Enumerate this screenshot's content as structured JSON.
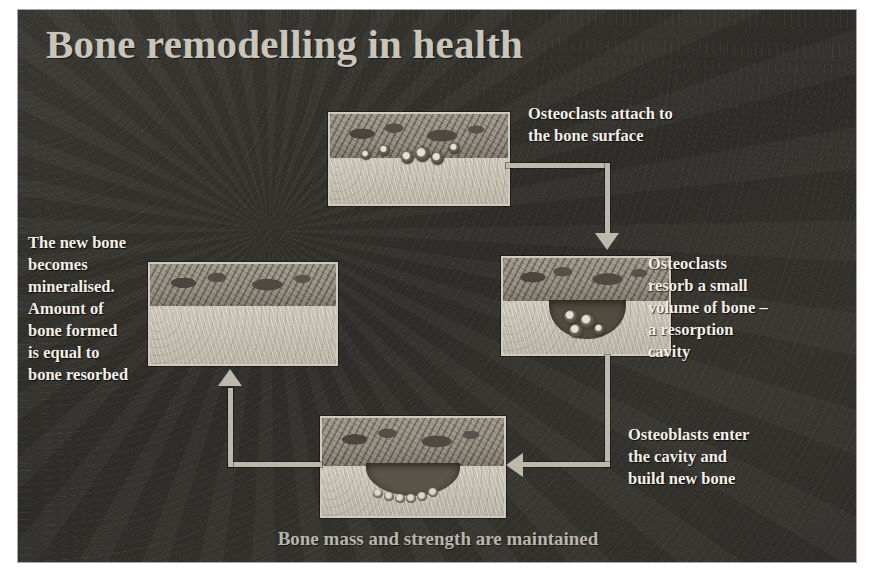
{
  "slide": {
    "title": "Bone remodelling in health",
    "footer_caption": "Bone mass and strength are maintained",
    "background_color": "#332f2b",
    "title_color": "#c9c5bb",
    "text_color": "#f2efe8",
    "arrow_color": "#bdb8ab"
  },
  "steps": [
    {
      "id": "step-1",
      "position": "top",
      "note": "Osteoclasts attach to the bone surface",
      "note_lines": [
        "Osteoclasts attach to",
        "the bone surface"
      ],
      "panel_caption": "micrograph-osteoclasts-on-bone-surface"
    },
    {
      "id": "step-2",
      "position": "right",
      "note": "Osteoclasts resorb a small volume of bone – a resorption cavity",
      "note_lines": [
        "Osteoclasts",
        "resorb a small",
        "volume of bone –",
        "a resorption",
        "cavity"
      ],
      "panel_caption": "micrograph-resorption-cavity"
    },
    {
      "id": "step-3",
      "position": "bottom",
      "note": "Osteoblasts enter the cavity and build new bone",
      "note_lines": [
        "Osteoblasts enter",
        "the cavity and",
        "build new bone"
      ],
      "panel_caption": "micrograph-osteoblasts-building-bone"
    },
    {
      "id": "step-4",
      "position": "left",
      "note": "The new bone becomes mineralised. Amount of bone formed is equal to bone resorbed",
      "note_lines": [
        "The new bone",
        "becomes",
        "mineralised.",
        "Amount of",
        "bone formed",
        "is equal to",
        "bone resorbed"
      ],
      "panel_caption": "micrograph-mineralised-new-bone"
    }
  ],
  "arrows": [
    {
      "id": "arrow-top-to-right",
      "from": "step-1",
      "to": "step-2",
      "direction": "down"
    },
    {
      "id": "arrow-right-to-bottom",
      "from": "step-2",
      "to": "step-3",
      "direction": "left"
    },
    {
      "id": "arrow-bottom-to-left",
      "from": "step-3",
      "to": "step-4",
      "direction": "up"
    }
  ]
}
